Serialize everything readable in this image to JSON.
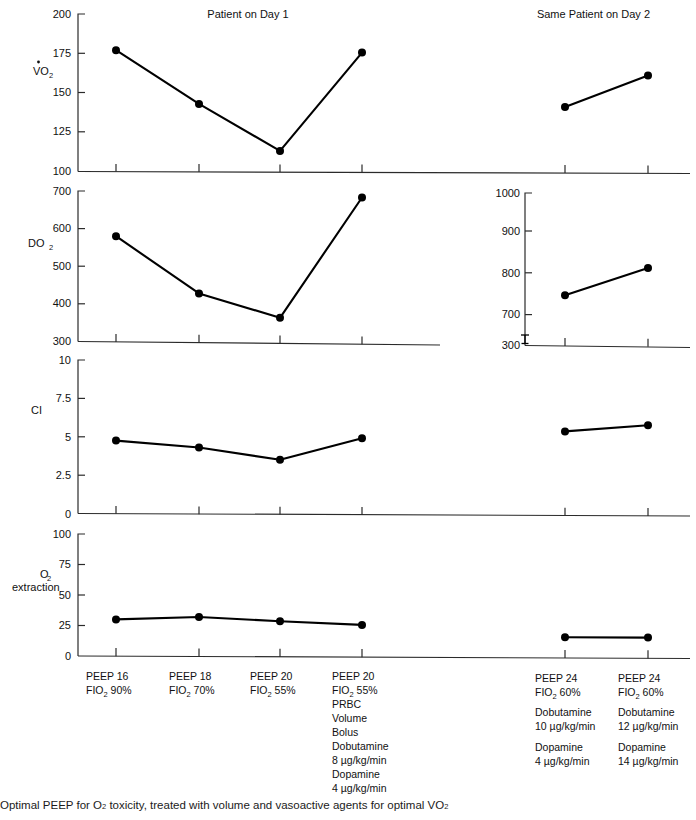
{
  "figure": {
    "panel_titles": {
      "left": "Patient on Day 1",
      "right": "Same Patient on Day 2"
    },
    "caption": "Optimal PEEP for O2 toxicity, treated with volume and vasoactive agents for optimal VO2",
    "caption_parts": {
      "a": "Optimal PEEP for O",
      "a_sub": "2",
      "b": " toxicity, treated with volume and vasoactive agents for optimal VO",
      "b_sub": "2"
    }
  },
  "axis_labels": {
    "vo2_main": "VO",
    "vo2_sub": "2",
    "do2_main": "DO",
    "do2_sub": "2",
    "ci": "CI",
    "o2ext_line1_main": "O",
    "o2ext_line1_sub": "2",
    "o2ext_line2": "extraction"
  },
  "categories_day1": [
    {
      "lines": [
        {
          "text": "PEEP 16"
        },
        {
          "pre": "FIO",
          "sub": "2",
          "post": " 90%"
        }
      ]
    },
    {
      "lines": [
        {
          "text": "PEEP 18"
        },
        {
          "pre": "FIO",
          "sub": "2",
          "post": " 70%"
        }
      ]
    },
    {
      "lines": [
        {
          "text": "PEEP 20"
        },
        {
          "pre": "FIO",
          "sub": "2",
          "post": " 55%"
        }
      ]
    },
    {
      "lines": [
        {
          "text": "PEEP 20"
        },
        {
          "pre": "FIO",
          "sub": "2",
          "post": " 55%"
        },
        {
          "text": "PRBC"
        },
        {
          "text": "Volume"
        },
        {
          "text": "Bolus"
        },
        {
          "text": "Dobutamine"
        },
        {
          "text": "8 µg/kg/min"
        },
        {
          "text": "Dopamine"
        },
        {
          "text": "4 µg/kg/min"
        }
      ]
    }
  ],
  "categories_day2": [
    {
      "lines": [
        {
          "text": "PEEP 24"
        },
        {
          "pre": "FIO",
          "sub": "2",
          "post": " 60%"
        },
        {
          "text": ""
        },
        {
          "text": "Dobutamine"
        },
        {
          "text": "10 µg/kg/min"
        },
        {
          "text": ""
        },
        {
          "text": "Dopamine"
        },
        {
          "text": "4 µg/kg/min"
        }
      ]
    },
    {
      "lines": [
        {
          "text": "PEEP 24"
        },
        {
          "pre": "FIO",
          "sub": "2",
          "post": " 60%"
        },
        {
          "text": ""
        },
        {
          "text": "Dobutamine"
        },
        {
          "text": "12 µg/kg/min"
        },
        {
          "text": ""
        },
        {
          "text": "Dopamine"
        },
        {
          "text": "14 µg/kg/min"
        }
      ]
    }
  ],
  "chart_data": [
    {
      "type": "line",
      "title": "Patient on Day 1",
      "panel": "VO2 - Day 1",
      "ylabel": "VO2",
      "xlabel": "",
      "ylim": [
        100,
        200
      ],
      "yticks": [
        100,
        125,
        150,
        175,
        200
      ],
      "ytick_labels": [
        "100",
        "125",
        "150",
        "175",
        "200"
      ],
      "grid": false,
      "categories": [
        "PEEP 16 / FIO2 90%",
        "PEEP 18 / FIO2 70%",
        "PEEP 20 / FIO2 55%",
        "PEEP 20 / FIO2 55% PRBC Volume Bolus"
      ],
      "values": [
        177,
        143,
        113,
        175.5
      ]
    },
    {
      "type": "line",
      "title": "Same Patient on Day 2",
      "panel": "VO2 - Day 2",
      "ylabel": "VO2",
      "xlabel": "",
      "ylim": [
        100,
        200
      ],
      "yticks": [
        100,
        125,
        150,
        175,
        200
      ],
      "ytick_labels": [
        "100",
        "125",
        "150",
        "175",
        "200"
      ],
      "grid": false,
      "categories": [
        "PEEP 24 / FIO2 60%",
        "PEEP 24 / FIO2 60%"
      ],
      "values": [
        141,
        161
      ]
    },
    {
      "type": "line",
      "panel": "DO2 - Day 1",
      "ylabel": "DO2",
      "xlabel": "",
      "ylim": [
        300,
        700
      ],
      "yticks": [
        300,
        400,
        500,
        600,
        700
      ],
      "ytick_labels": [
        "300",
        "400",
        "500",
        "600",
        "700"
      ],
      "grid": false,
      "categories": [
        "PEEP 16 / FIO2 90%",
        "PEEP 18 / FIO2 70%",
        "PEEP 20 / FIO2 55%",
        "PEEP 20 / FIO2 55% PRBC Volume Bolus"
      ],
      "values": [
        580,
        428,
        363,
        683
      ]
    },
    {
      "type": "line",
      "panel": "DO2 - Day 2",
      "ylabel": "DO2",
      "xlabel": "",
      "ylim": [
        700,
        1000
      ],
      "axis_break": true,
      "axis_break_note": "axis broken between 300 and 700",
      "yticks": [
        300,
        700,
        800,
        900,
        1000
      ],
      "ytick_labels": [
        "300",
        "700",
        "800",
        "900",
        "1000"
      ],
      "grid": false,
      "categories": [
        "PEEP 24 / FIO2 60%",
        "PEEP 24 / FIO2 60%"
      ],
      "values": [
        748,
        815
      ]
    },
    {
      "type": "line",
      "panel": "CI - Day 1",
      "ylabel": "CI",
      "xlabel": "",
      "ylim": [
        0,
        10
      ],
      "yticks": [
        0,
        2.5,
        5,
        7.5,
        10
      ],
      "ytick_labels": [
        "0",
        "2.5",
        "5",
        "7.5",
        "10"
      ],
      "grid": false,
      "categories": [
        "PEEP 16 / FIO2 90%",
        "PEEP 18 / FIO2 70%",
        "PEEP 20 / FIO2 55%",
        "PEEP 20 / FIO2 55% PRBC Volume Bolus"
      ],
      "values": [
        4.75,
        4.3,
        3.5,
        4.9
      ]
    },
    {
      "type": "line",
      "panel": "CI - Day 2",
      "ylabel": "CI",
      "xlabel": "",
      "ylim": [
        0,
        10
      ],
      "yticks": [
        0,
        2.5,
        5,
        7.5,
        10
      ],
      "ytick_labels": [
        "0",
        "2.5",
        "5",
        "7.5",
        "10"
      ],
      "grid": false,
      "categories": [
        "PEEP 24 / FIO2 60%",
        "PEEP 24 / FIO2 60%"
      ],
      "values": [
        5.35,
        5.75
      ]
    },
    {
      "type": "line",
      "panel": "O2 extraction - Day 1",
      "ylabel": "O2 extraction",
      "xlabel": "",
      "ylim": [
        0,
        100
      ],
      "yticks": [
        0,
        25,
        50,
        75,
        100
      ],
      "ytick_labels": [
        "0",
        "25",
        "50",
        "75",
        "100"
      ],
      "grid": false,
      "categories": [
        "PEEP 16 / FIO2 90%",
        "PEEP 18 / FIO2 70%",
        "PEEP 20 / FIO2 55%",
        "PEEP 20 / FIO2 55% PRBC Volume Bolus"
      ],
      "values": [
        30,
        32,
        28.5,
        25.5
      ]
    },
    {
      "type": "line",
      "panel": "O2 extraction - Day 2",
      "ylabel": "O2 extraction",
      "xlabel": "",
      "ylim": [
        0,
        100
      ],
      "yticks": [
        0,
        25,
        50,
        75,
        100
      ],
      "ytick_labels": [
        "0",
        "25",
        "50",
        "75",
        "100"
      ],
      "grid": false,
      "categories": [
        "PEEP 24 / FIO2 60%",
        "PEEP 24 / FIO2 60%"
      ],
      "values": [
        16.5,
        16.5
      ]
    }
  ],
  "ticks": {
    "vo2": [
      "200",
      "175",
      "150",
      "125",
      "100"
    ],
    "do2_left": [
      "700",
      "600",
      "500",
      "400",
      "300"
    ],
    "do2_right": [
      "1000",
      "900",
      "800",
      "700",
      "300"
    ],
    "ci": [
      "10",
      "7.5",
      "5",
      "2.5",
      "0"
    ],
    "o2ext": [
      "100",
      "75",
      "50",
      "25",
      "0"
    ]
  }
}
